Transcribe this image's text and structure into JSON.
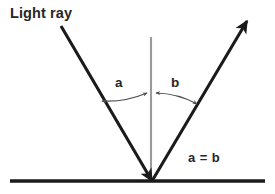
{
  "diagram": {
    "background_color": "#ffffff",
    "labels": {
      "light_ray": "Light ray",
      "angle_a": "a",
      "angle_b": "b",
      "equality": "a = b"
    },
    "colors": {
      "ray": "#1a1a1a",
      "surface": "#1a1a1a",
      "normal": "#9a9a9a",
      "arc": "#4d4d4d",
      "text": "#262626"
    },
    "geometry": {
      "vertex": {
        "x": 152,
        "y": 181
      },
      "incident_ray": {
        "x1": 61,
        "y1": 26,
        "x2": 152,
        "y2": 181
      },
      "reflected_ray": {
        "x1": 152,
        "y1": 181,
        "x2": 247,
        "y2": 21
      },
      "normal_line": {
        "x1": 151,
        "y1": 37,
        "x2": 151,
        "y2": 181
      },
      "surface_line": {
        "x1": 10,
        "y1": 181,
        "x2": 265,
        "y2": 181
      },
      "arc_a": {
        "x1": 102,
        "y1": 101,
        "x2": 147,
        "y2": 93
      },
      "arc_b": {
        "x1": 156,
        "y1": 93,
        "x2": 197,
        "y2": 104
      }
    }
  }
}
